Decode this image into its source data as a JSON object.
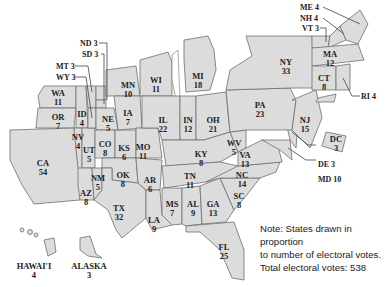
{
  "map": {
    "title": "Electoral votes by state (states drawn in proportion)",
    "fill_color": "#dcdcdc",
    "border_color": "#6e6e6e",
    "states": [
      {
        "abbr": "WA",
        "votes": "11",
        "x": 58,
        "y": 89
      },
      {
        "abbr": "OR",
        "votes": "7",
        "x": 58,
        "y": 115
      },
      {
        "abbr": "CA",
        "votes": "54",
        "x": 43,
        "y": 187
      },
      {
        "abbr": "ID",
        "votes": "4",
        "x": 82,
        "y": 112
      },
      {
        "abbr": "NV",
        "votes": "4",
        "x": 77,
        "y": 135
      },
      {
        "abbr": "UT",
        "votes": "5",
        "x": 89,
        "y": 148
      },
      {
        "abbr": "AZ",
        "votes": "8",
        "x": 86,
        "y": 191
      },
      {
        "abbr": "NM",
        "votes": "5",
        "x": 98,
        "y": 175
      },
      {
        "abbr": "CO",
        "votes": "8",
        "x": 105,
        "y": 143
      },
      {
        "abbr": "NE",
        "votes": "5",
        "x": 108,
        "y": 117
      },
      {
        "abbr": "KS",
        "votes": "6",
        "x": 123,
        "y": 146
      },
      {
        "abbr": "OK",
        "votes": "8",
        "x": 123,
        "y": 173
      },
      {
        "abbr": "TX",
        "votes": "32",
        "x": 119,
        "y": 208
      },
      {
        "abbr": "MN",
        "votes": "10",
        "x": 128,
        "y": 83
      },
      {
        "abbr": "IA",
        "votes": "7",
        "x": 128,
        "y": 113
      },
      {
        "abbr": "MO",
        "votes": "11",
        "x": 143,
        "y": 145
      },
      {
        "abbr": "AR",
        "votes": "6",
        "x": 150,
        "y": 178
      },
      {
        "abbr": "LA",
        "votes": "9",
        "x": 154,
        "y": 219
      },
      {
        "abbr": "WI",
        "votes": "11",
        "x": 156,
        "y": 79
      },
      {
        "abbr": "IL",
        "votes": "22",
        "x": 163,
        "y": 119
      },
      {
        "abbr": "IN",
        "votes": "12",
        "x": 188,
        "y": 119
      },
      {
        "abbr": "MI",
        "votes": "18",
        "x": 198,
        "y": 74
      },
      {
        "abbr": "OH",
        "votes": "21",
        "x": 212,
        "y": 120
      },
      {
        "abbr": "KY",
        "votes": "8",
        "x": 200,
        "y": 154
      },
      {
        "abbr": "TN",
        "votes": "11",
        "x": 190,
        "y": 180
      },
      {
        "abbr": "MS",
        "votes": "7",
        "x": 172,
        "y": 205
      },
      {
        "abbr": "AL",
        "votes": "9",
        "x": 192,
        "y": 204
      },
      {
        "abbr": "GA",
        "votes": "13",
        "x": 213,
        "y": 204
      },
      {
        "abbr": "FL",
        "votes": "25",
        "x": 224,
        "y": 245
      },
      {
        "abbr": "SC",
        "votes": "8",
        "x": 238,
        "y": 195
      },
      {
        "abbr": "NC",
        "votes": "14",
        "x": 242,
        "y": 174
      },
      {
        "abbr": "VA",
        "votes": "13",
        "x": 244,
        "y": 153
      },
      {
        "abbr": "WV",
        "votes": "5",
        "x": 232,
        "y": 140
      },
      {
        "abbr": "PA",
        "votes": "23",
        "x": 259,
        "y": 103
      },
      {
        "abbr": "NY",
        "votes": "33",
        "x": 285,
        "y": 60
      },
      {
        "abbr": "NJ",
        "votes": "15",
        "x": 304,
        "y": 117
      },
      {
        "abbr": "MA",
        "votes": "12",
        "x": 328,
        "y": 52
      },
      {
        "abbr": "CT",
        "votes": "8",
        "x": 324,
        "y": 77
      },
      {
        "abbr": "DC",
        "votes": "3",
        "x": 338,
        "y": 141
      },
      {
        "abbr": "HAWAI'I",
        "votes": "4",
        "x": 34,
        "y": 262
      },
      {
        "abbr": "ALASKA",
        "votes": "3",
        "x": 89,
        "y": 262
      }
    ],
    "callouts": [
      {
        "text": "ND 3",
        "x": 80,
        "y": 39
      },
      {
        "text": "SD 3",
        "x": 82,
        "y": 50
      },
      {
        "text": "MT 3",
        "x": 56,
        "y": 62
      },
      {
        "text": "WY 3",
        "x": 56,
        "y": 73
      },
      {
        "text": "ME 4",
        "x": 300,
        "y": 4
      },
      {
        "text": "NH 4",
        "x": 300,
        "y": 15
      },
      {
        "text": "VT 3",
        "x": 300,
        "y": 25
      },
      {
        "text": "RI 4",
        "x": 361,
        "y": 93
      },
      {
        "text": "DE 3",
        "x": 318,
        "y": 161
      },
      {
        "text": "MD 10",
        "x": 318,
        "y": 176
      }
    ]
  },
  "note": {
    "line1": "Note: States drawn in proportion",
    "line2": "to number of electoral votes.",
    "line3": "Total electoral votes: 538"
  }
}
